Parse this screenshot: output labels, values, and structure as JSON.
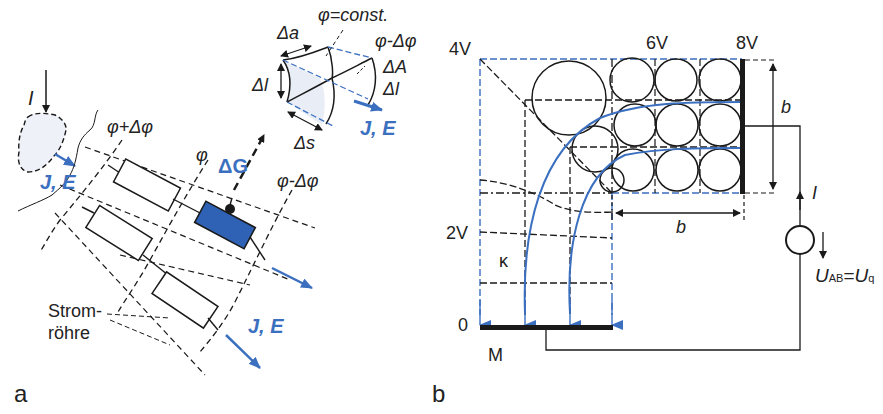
{
  "panels": {
    "a": {
      "panel_label": "a",
      "current_label": "I",
      "field_label_small": "J, E",
      "equipotential_labels": [
        "φ+Δφ",
        "φ",
        "φ-Δφ"
      ],
      "conductance_label": "ΔG",
      "volume_element": {
        "phi_const": "φ=const.",
        "phi_minus": "φ-Δφ",
        "delta_a": "Δa",
        "delta_l_left": "Δl",
        "delta_A": "ΔA",
        "delta_l_right": "Δl",
        "delta_s": "Δs",
        "field_label": "J, E"
      },
      "flux_tube_label_line1": "Strom-",
      "flux_tube_label_line2": "röhre",
      "field_label_bottom": "J, E"
    },
    "b": {
      "panel_label": "b",
      "potentials": [
        "4V",
        "6V",
        "8V",
        "2V",
        "0"
      ],
      "conductivity_label": "κ",
      "ground_label": "M",
      "width_label_vertical": "b",
      "width_label_horizontal": "b",
      "current_label": "I",
      "voltage_label_main": "U",
      "voltage_label_sub": "AB",
      "voltage_equals": "=",
      "voltage_q_main": "U",
      "voltage_q_sub": "q"
    }
  },
  "colors": {
    "accent_blue": "#3b6fc0",
    "resistor_fill": "#2f62b5",
    "line": "#1a1a1a"
  }
}
